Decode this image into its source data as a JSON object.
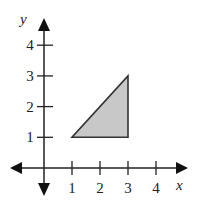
{
  "chart_data": {
    "type": "area",
    "title": "",
    "xlabel": "x",
    "ylabel": "y",
    "xlim": [
      -1,
      5
    ],
    "ylim": [
      -1,
      5
    ],
    "grid": false,
    "x_ticks": [
      1,
      2,
      3,
      4
    ],
    "y_ticks": [
      1,
      2,
      3,
      4
    ],
    "x_tick_labels": [
      "1",
      "2",
      "3",
      "4"
    ],
    "y_tick_labels": [
      "1",
      "2",
      "3",
      "4"
    ],
    "series": [
      {
        "name": "triangle",
        "shape": "polygon",
        "points": [
          [
            1,
            1
          ],
          [
            3,
            1
          ],
          [
            3,
            3
          ]
        ],
        "fill": "#c8c8c8",
        "stroke": "#333333"
      }
    ]
  }
}
